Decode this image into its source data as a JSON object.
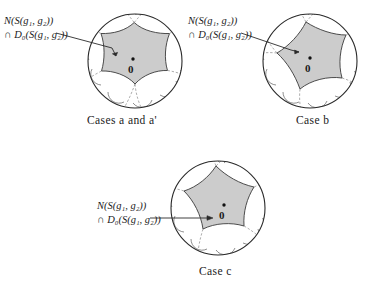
{
  "figure": {
    "background_color": "#ffffff",
    "ink_color": "#1a1a1a",
    "shade_color": "#cccccc",
    "dashed_color": "#8a8a8a"
  },
  "panels": [
    {
      "id": "panel-a",
      "caption": "Cases a and a'",
      "origin_label": "0",
      "label_line1": "N(S(g₁, g₂))",
      "label_line2": "∩ D₀(S(g₁, g₂))",
      "disk": {
        "cx": 135,
        "cy": 61,
        "r": 47
      },
      "sides": 6,
      "rotation_deg": 8,
      "arrow": {
        "x1": 58,
        "y1": 34,
        "x2": 113,
        "y2": 52
      },
      "caption_pos": {
        "x": 92,
        "y": 118
      },
      "label_pos": {
        "x": 4,
        "y": 16
      },
      "origin_dot": {
        "x": 133,
        "y": 61
      },
      "origin_text_pos": {
        "x": 129,
        "y": 68
      }
    },
    {
      "id": "panel-b",
      "caption": "Case b",
      "origin_label": "0",
      "label_line1": "N(S(g₁, g₂))",
      "label_line2": "∩ D₀(S(g₁, g₂))",
      "disk": {
        "cx": 310,
        "cy": 61,
        "r": 47
      },
      "sides": 5,
      "rotation_deg": 20,
      "arrow": {
        "x1": 243,
        "y1": 34,
        "x2": 290,
        "y2": 52
      },
      "caption_pos": {
        "x": 294,
        "y": 118
      },
      "label_pos": {
        "x": 188,
        "y": 16
      },
      "origin_dot": {
        "x": 310,
        "y": 58
      },
      "origin_text_pos": {
        "x": 306,
        "y": 66
      }
    },
    {
      "id": "panel-c",
      "caption": "Case c",
      "origin_label": "0",
      "label_line1": "N(S(g₁, g₂))",
      "label_line2": "∩ D₀(S(g₁, g₂))",
      "disk": {
        "cx": 218,
        "cy": 208
      },
      "sides": 5,
      "rotation_deg": 0,
      "arrow": {
        "x1": 152,
        "y1": 218,
        "x2": 205,
        "y2": 218
      },
      "caption_pos": {
        "x": 197,
        "y": 268
      },
      "label_pos": {
        "x": 97,
        "y": 200
      },
      "origin_dot": {
        "x": 224,
        "y": 205
      },
      "origin_text_pos": {
        "x": 220,
        "y": 213
      }
    }
  ]
}
